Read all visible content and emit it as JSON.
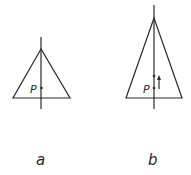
{
  "figure": {
    "panels": [
      {
        "id": "a",
        "caption": "a",
        "point_label": "P",
        "description": "Isosceles triangle with vertical axis through apex; point P on axis near base"
      },
      {
        "id": "b",
        "caption": "b",
        "point_label": "P",
        "description": "Taller isosceles triangle with vertical axis; point P on axis with a shifted point above and an upward arrow"
      }
    ],
    "colors": {
      "line": "#2a2a2a",
      "background": "#ffffff"
    }
  }
}
